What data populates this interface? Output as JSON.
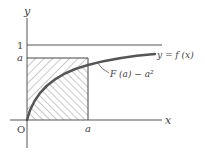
{
  "diagram": {
    "type": "function-graph",
    "axes": {
      "x_label": "x",
      "y_label": "y",
      "origin_label": "O"
    },
    "ticks": {
      "y_one": "1",
      "y_a": "a",
      "x_a": "a"
    },
    "curve_label": "y = f (x)",
    "region_label": "F (a) − a²",
    "lines": [
      {
        "name": "asymptote",
        "equation": "y = 1"
      },
      {
        "name": "level-a",
        "equation": "y = a"
      },
      {
        "name": "vertical-a",
        "equation": "x = a"
      }
    ],
    "regions": [
      {
        "name": "above-curve-in-square",
        "hatch": "backslash"
      },
      {
        "name": "below-curve-in-square",
        "hatch": "slash"
      }
    ],
    "colors": {
      "ink": "#444444",
      "curve": "#555555",
      "hatch": "#777777",
      "background": "#ffffff"
    }
  }
}
